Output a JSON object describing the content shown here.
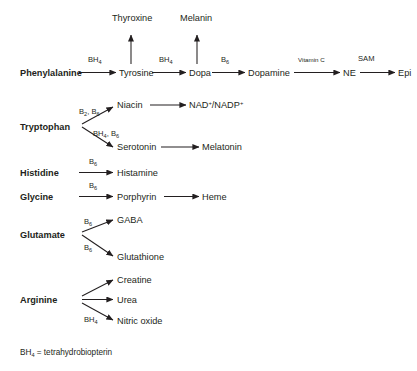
{
  "diagram": {
    "footnote": "BH",
    "footnote_sub": "4",
    "footnote_rest": " = tetrahydrobiopterin",
    "colors": {
      "background": "#ffffff",
      "ink": "#231f20"
    }
  },
  "nodes": {
    "phenylalanine": "Phenylalanine",
    "tyrosine": "Tyrosine",
    "dopa": "Dopa",
    "dopamine": "Dopamine",
    "ne": "NE",
    "epi": "Epi",
    "thyroxine": "Thyroxine",
    "melanin": "Melanin",
    "tryptophan": "Tryptophan",
    "niacin": "Niacin",
    "nad": "NAD",
    "nad_sup1": "+",
    "nad_mid": "/NADP",
    "nad_sup2": "+",
    "serotonin": "Serotonin",
    "melatonin": "Melatonin",
    "histidine": "Histidine",
    "histamine": "Histamine",
    "glycine": "Glycine",
    "porphyrin": "Porphyrin",
    "heme": "Heme",
    "glutamate": "Glutamate",
    "gaba": "GABA",
    "glutathione": "Glutathione",
    "arginine": "Arginine",
    "creatine": "Creatine",
    "urea": "Urea",
    "nitric_oxide": "Nitric oxide"
  },
  "cofactors": {
    "phe_to_tyr": {
      "base": "BH",
      "sub": "4"
    },
    "tyr_to_dopa": {
      "base": "BH",
      "sub": "4"
    },
    "dopa_to_dopamine": {
      "base": "B",
      "sub": "6"
    },
    "dopamine_to_ne": {
      "text": "Vitamin C"
    },
    "ne_to_epi": {
      "text": "SAM"
    },
    "trp_to_niacin": {
      "base": "B",
      "sub": "2",
      "base2": ", B",
      "sub2": "6"
    },
    "trp_to_serotonin": {
      "base": "BH",
      "sub": "4",
      "base2": ", B",
      "sub2": "6"
    },
    "his_to_histamine": {
      "base": "B",
      "sub": "6"
    },
    "gly_to_porphyrin": {
      "base": "B",
      "sub": "6"
    },
    "glu_to_gaba": {
      "base": "B",
      "sub": "6"
    },
    "glu_to_glutathione": {
      "base": "B",
      "sub": "6"
    },
    "arg_to_no": {
      "base": "BH",
      "sub": "4"
    }
  }
}
